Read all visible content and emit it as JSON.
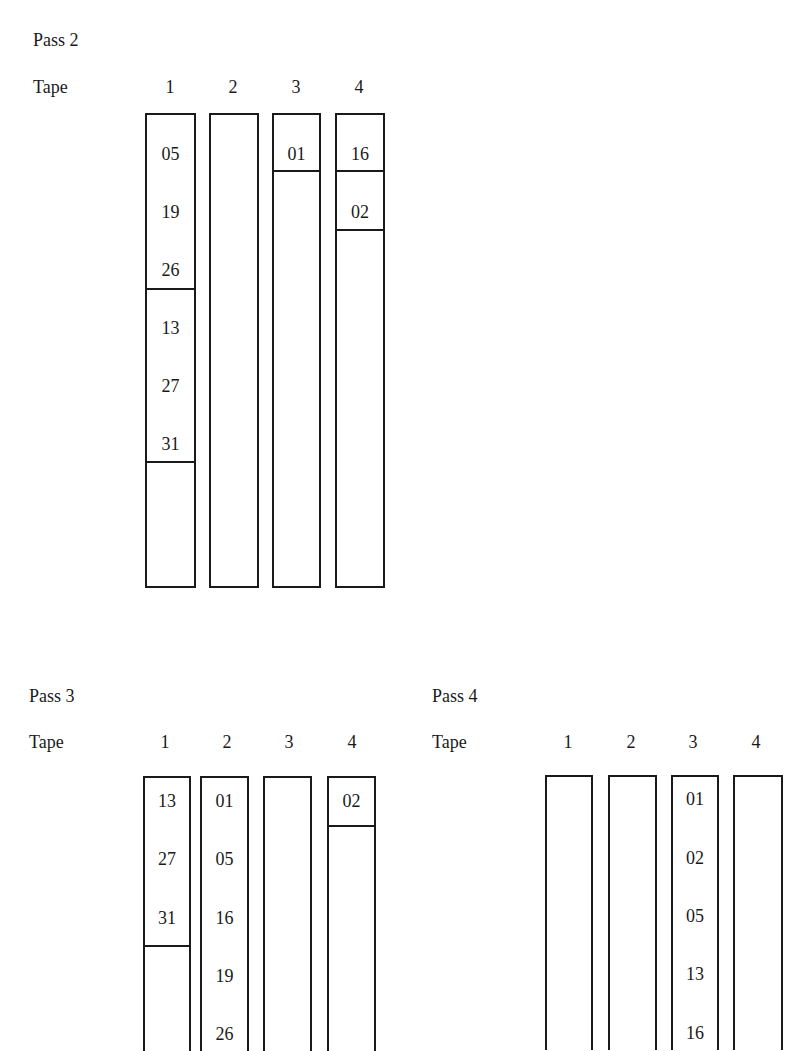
{
  "pass2": {
    "title": "Pass 2",
    "tape_label": "Tape",
    "tape_numbers": [
      "1",
      "2",
      "3",
      "4"
    ],
    "tapes": [
      {
        "records": [
          "05",
          "19",
          "26",
          "13",
          "27",
          "31"
        ]
      },
      {
        "records": []
      },
      {
        "records": [
          "01"
        ]
      },
      {
        "records": [
          "16",
          "02"
        ]
      }
    ]
  },
  "pass3": {
    "title": "Pass 3",
    "tape_label": "Tape",
    "tape_numbers": [
      "1",
      "2",
      "3",
      "4"
    ],
    "tapes": [
      {
        "records": [
          "13",
          "27",
          "31"
        ]
      },
      {
        "records": [
          "01",
          "05",
          "16",
          "19",
          "26"
        ]
      },
      {
        "records": []
      },
      {
        "records": [
          "02"
        ]
      }
    ]
  },
  "pass4": {
    "title": "Pass 4",
    "tape_label": "Tape",
    "tape_numbers": [
      "1",
      "2",
      "3",
      "4"
    ],
    "tapes": [
      {
        "records": []
      },
      {
        "records": []
      },
      {
        "records": [
          "01",
          "02",
          "05",
          "13",
          "16"
        ]
      },
      {
        "records": []
      }
    ]
  }
}
